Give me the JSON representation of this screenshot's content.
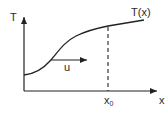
{
  "diagram": {
    "axes": {
      "y_label": "T",
      "x_label": "x"
    },
    "curve": {
      "label": "T(x)",
      "shape": "S-shaped increasing curve, rising steeply then leveling off"
    },
    "marker": {
      "label_main": "x",
      "label_sub": "0",
      "style": "dashed vertical line from curve down to x-axis"
    },
    "velocity": {
      "label": "u",
      "direction": "right"
    },
    "colors": {
      "stroke": "#222222",
      "background": "#ffffff"
    }
  }
}
